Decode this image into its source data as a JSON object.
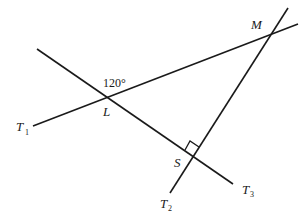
{
  "diagram": {
    "type": "geometry",
    "points": {
      "L": {
        "label": "L"
      },
      "M": {
        "label": "M"
      },
      "S": {
        "label": "S"
      }
    },
    "lines": [
      {
        "name": "T",
        "subscript": "1"
      },
      {
        "name": "T",
        "subscript": "2"
      },
      {
        "name": "T",
        "subscript": "3"
      }
    ],
    "angle_label": "120°",
    "right_angle_at": "S",
    "colors": {
      "stroke": "#1a1a1a",
      "background": "#ffffff"
    }
  }
}
